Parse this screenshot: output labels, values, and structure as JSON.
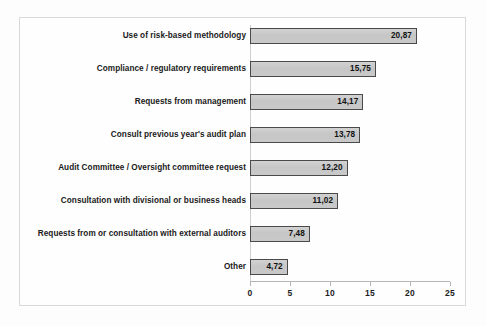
{
  "chart_data": {
    "type": "bar",
    "orientation": "horizontal",
    "title": "",
    "subtitle": "",
    "xlabel": "",
    "ylabel": "",
    "xlim": [
      0,
      25
    ],
    "xticks": [
      "0",
      "5",
      "10",
      "15",
      "20",
      "25"
    ],
    "xtick_values": [
      0,
      5,
      10,
      15,
      20,
      25
    ],
    "grid": false,
    "legend": false,
    "decimal_separator": ",",
    "categories": [
      "Use of risk-based methodology",
      "Compliance / regulatory requirements",
      "Requests from management",
      "Consult previous year's audit plan",
      "Audit Committee / Oversight committee request",
      "Consultation with divisional or business heads",
      "Requests from or consultation with external auditors",
      "Other"
    ],
    "values": [
      20.87,
      15.75,
      14.17,
      13.78,
      12.2,
      11.02,
      7.48,
      4.72
    ],
    "value_labels": [
      "20,87",
      "15,75",
      "14,17",
      "13,78",
      "12,20",
      "11,02",
      "7,48",
      "4,72"
    ],
    "colors": {
      "bar_fill": "#c9c9c9",
      "bar_border": "#4a4a4a",
      "axis": "#b5b5b5",
      "text": "#1a1a1a",
      "background": "#fdfdfd",
      "frame": "#d9d9d9"
    }
  }
}
